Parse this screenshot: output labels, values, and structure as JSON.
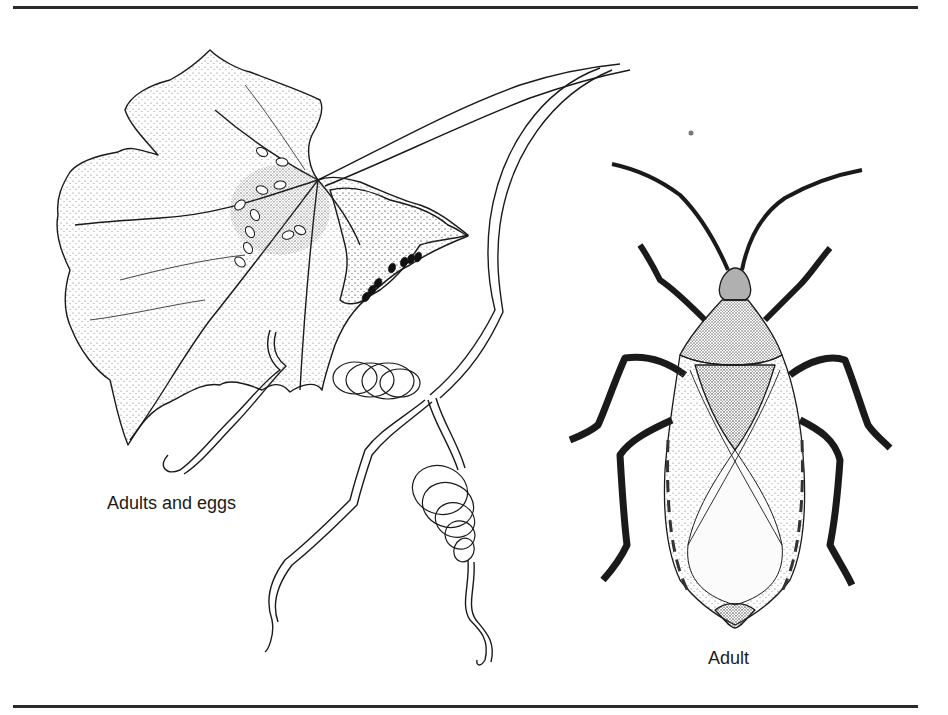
{
  "figure": {
    "panels": [
      {
        "id": "leaf",
        "caption": "Adults and eggs"
      },
      {
        "id": "bug",
        "caption": "Adult"
      }
    ]
  },
  "colors": {
    "ink": "#1a1a1a",
    "rule": "#2a2a2a",
    "background": "#ffffff",
    "stipple": "#555555",
    "egg": "#111111"
  }
}
